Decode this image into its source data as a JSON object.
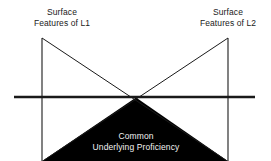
{
  "diagram": {
    "background_color": "#ffffff",
    "line_color": "#1a1a1a",
    "fill_color": "#000000",
    "label_text_color": "#1a1a1a",
    "inverse_text_color": "#f2f2f2",
    "labels": {
      "left_peak": {
        "line1": "Surface",
        "line2": "Features of L1"
      },
      "right_peak": {
        "line1": "Surface",
        "line2": "Features of L2"
      },
      "submerged_region": {
        "line1": "Common",
        "line2": "Underlying Proficiency"
      }
    },
    "geometry": {
      "width": 271,
      "height": 161,
      "waterline_y": 97,
      "waterline_x_start": 14,
      "waterline_x_end": 255,
      "left_vertical_x": 42,
      "right_vertical_x": 228,
      "peak_top_y": 38,
      "crossing_point_x": 136,
      "crossing_point_y": 98
    }
  }
}
